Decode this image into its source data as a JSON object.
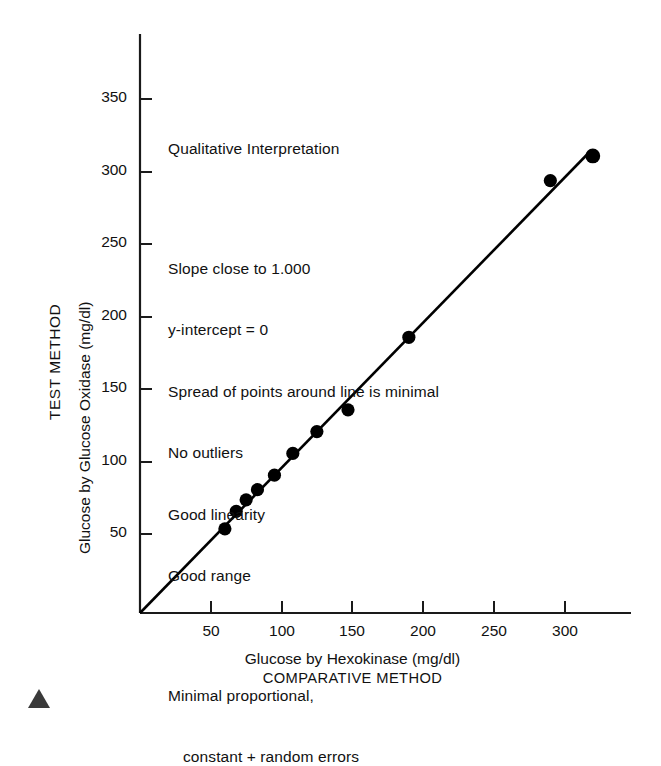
{
  "chart_data": {
    "type": "scatter",
    "title": "",
    "xlabel": "Glucose by Hexokinase (mg/dl)",
    "xlabel_sub": "COMPARATIVE METHOD",
    "ylabel": "Glucose by Glucose Oxidase (mg/dl)",
    "ylabel_sub": "TEST METHOD",
    "xlim": [
      0,
      347
    ],
    "ylim": [
      0,
      399
    ],
    "xticks": [
      50,
      100,
      150,
      200,
      250,
      300
    ],
    "yticks": [
      50,
      100,
      150,
      200,
      250,
      300,
      350
    ],
    "grid": false,
    "legend": "none",
    "x": [
      60,
      68,
      75,
      83,
      95,
      108,
      125,
      147,
      190,
      290,
      320
    ],
    "y": [
      58,
      70,
      78,
      85,
      95,
      110,
      125,
      140,
      190,
      298,
      315
    ],
    "points": [
      {
        "x": 60,
        "y": 58
      },
      {
        "x": 68,
        "y": 70
      },
      {
        "x": 75,
        "y": 78
      },
      {
        "x": 83,
        "y": 85
      },
      {
        "x": 95,
        "y": 95
      },
      {
        "x": 108,
        "y": 110
      },
      {
        "x": 125,
        "y": 125
      },
      {
        "x": 147,
        "y": 140
      },
      {
        "x": 190,
        "y": 190
      },
      {
        "x": 290,
        "y": 298
      },
      {
        "x": 320,
        "y": 315
      }
    ],
    "fit_line": {
      "slope": 1.0,
      "intercept": 0,
      "x_start": 0,
      "x_end": 317,
      "y_start": 0,
      "y_end": 317
    },
    "marker_color": "#000000",
    "line_color": "#000000",
    "axis_color": "#1a1a1a"
  },
  "annotation": {
    "heading": "Qualitative Interpretation",
    "lines": [
      "Slope close to 1.000",
      "y-intercept = 0",
      "Spread of points around line is minimal",
      "No outliers",
      "Good linearity",
      "Good range"
    ],
    "footer_line1": "Minimal proportional,",
    "footer_line2": "constant + random errors"
  },
  "axes": {
    "y_tick_labels": [
      "350",
      "300",
      "250",
      "200",
      "150",
      "100",
      "50"
    ],
    "x_tick_labels": [
      "50",
      "100",
      "150",
      "200",
      "250",
      "300"
    ],
    "y_title_main": "Glucose by Glucose Oxidase (mg/dl)",
    "y_title_method": "TEST METHOD",
    "x_title_main": "Glucose by Hexokinase (mg/dl)",
    "x_title_method": "COMPARATIVE METHOD"
  },
  "figure_marker": {
    "shape": "triangle",
    "color": "#3a3a3a"
  }
}
